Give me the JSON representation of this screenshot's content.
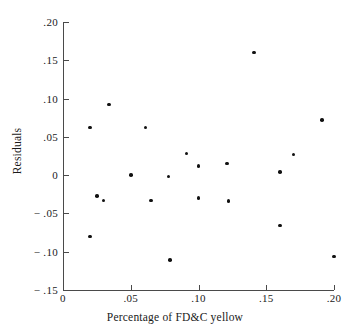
{
  "chart_data": {
    "type": "scatter",
    "title": "",
    "xlabel": "Percentage of FD&C yellow",
    "ylabel": "Residuals",
    "xlim": [
      0,
      0.2
    ],
    "ylim": [
      -0.15,
      0.2
    ],
    "grid": false,
    "legend": null,
    "xticks": [
      0,
      0.05,
      0.1,
      0.15,
      0.2
    ],
    "xtick_labels": [
      "0",
      ".05",
      ".10",
      ".15",
      ".20"
    ],
    "yticks": [
      0.2,
      0.15,
      0.1,
      0.05,
      0,
      -0.05,
      -0.1,
      -0.15
    ],
    "ytick_labels": [
      ".20",
      ".15",
      ".10",
      ".05",
      "0",
      "− .05",
      "− .10",
      "− .15"
    ],
    "marker": "filled-circle",
    "marker_color": "#111111",
    "axis_color": "#4a4a4a",
    "points": [
      {
        "x": 0.02,
        "y": 0.062
      },
      {
        "x": 0.02,
        "y": -0.08
      },
      {
        "x": 0.025,
        "y": -0.027
      },
      {
        "x": 0.03,
        "y": -0.033
      },
      {
        "x": 0.034,
        "y": 0.092
      },
      {
        "x": 0.05,
        "y": 0.0
      },
      {
        "x": 0.061,
        "y": 0.062
      },
      {
        "x": 0.065,
        "y": -0.033
      },
      {
        "x": 0.078,
        "y": -0.002
      },
      {
        "x": 0.079,
        "y": -0.111
      },
      {
        "x": 0.091,
        "y": 0.028
      },
      {
        "x": 0.1,
        "y": 0.012
      },
      {
        "x": 0.1,
        "y": -0.03
      },
      {
        "x": 0.121,
        "y": 0.015
      },
      {
        "x": 0.122,
        "y": -0.034
      },
      {
        "x": 0.141,
        "y": 0.16
      },
      {
        "x": 0.16,
        "y": 0.004
      },
      {
        "x": 0.16,
        "y": -0.066
      },
      {
        "x": 0.17,
        "y": 0.027
      },
      {
        "x": 0.191,
        "y": 0.072
      },
      {
        "x": 0.2,
        "y": -0.106
      }
    ]
  }
}
